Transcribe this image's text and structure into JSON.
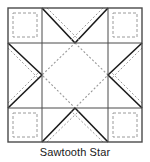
{
  "diagram": {
    "title": "Sawtooth Star",
    "type": "quilt-block-pattern",
    "caption": "Sawtooth Star",
    "colors": {
      "background": "#ffffff",
      "outline": "#4a4a4a",
      "seam_solid": "#1a1a1a",
      "seam_dotted": "#9a9a9a",
      "caption_text": "#1a1a1a"
    },
    "grid": {
      "columns": 3,
      "rows": 3,
      "x_lines": [
        8,
        42,
        108,
        142
      ],
      "y_lines": [
        8,
        43,
        108,
        142
      ],
      "column_labels": [
        "left",
        "center",
        "right"
      ],
      "row_labels": [
        "top",
        "middle",
        "bottom"
      ]
    },
    "cells": [
      {
        "name": "top-left-corner-square",
        "row": "top",
        "column": "left",
        "unit": "plain-square",
        "marking": "dashed-inset-square"
      },
      {
        "name": "top-flying-geese",
        "row": "top",
        "column": "center",
        "unit": "flying-geese",
        "point_direction": "down",
        "marking": "solid-diagonals-with-dotted-seams"
      },
      {
        "name": "top-right-corner-square",
        "row": "top",
        "column": "right",
        "unit": "plain-square",
        "marking": "dashed-inset-square"
      },
      {
        "name": "left-flying-geese",
        "row": "middle",
        "column": "left",
        "unit": "flying-geese",
        "point_direction": "right",
        "marking": "solid-diagonals-with-dotted-seams"
      },
      {
        "name": "center-square-on-point",
        "row": "middle",
        "column": "center",
        "unit": "center-square",
        "marking": "dotted-diamond"
      },
      {
        "name": "right-flying-geese",
        "row": "middle",
        "column": "right",
        "unit": "flying-geese",
        "point_direction": "left",
        "marking": "solid-diagonals-with-dotted-seams"
      },
      {
        "name": "bottom-left-corner-square",
        "row": "bottom",
        "column": "left",
        "unit": "plain-square",
        "marking": "dashed-inset-square"
      },
      {
        "name": "bottom-flying-geese",
        "row": "bottom",
        "column": "center",
        "unit": "flying-geese",
        "point_direction": "up",
        "marking": "solid-diagonals-with-dotted-seams"
      },
      {
        "name": "bottom-right-corner-square",
        "row": "bottom",
        "column": "right",
        "unit": "plain-square",
        "marking": "dashed-inset-square"
      }
    ]
  }
}
